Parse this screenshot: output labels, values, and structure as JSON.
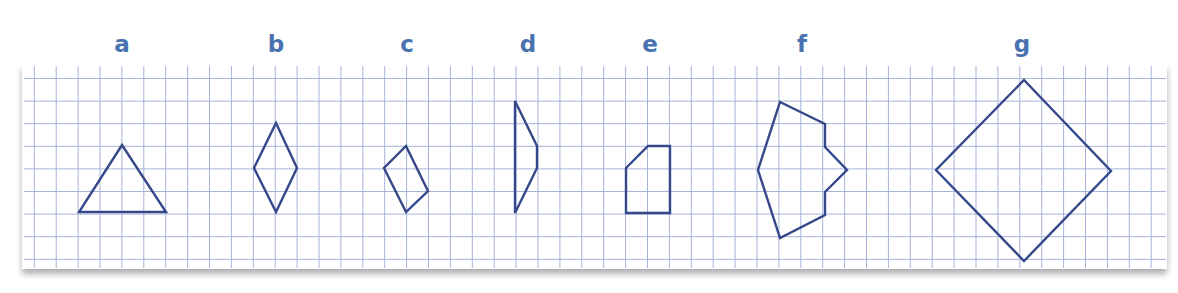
{
  "colors": {
    "label": "#4a72b0",
    "shape_stroke": "#36478a",
    "grid": "#a6b3da",
    "paper": "#ffffff",
    "shadow": "#9a9a9a"
  },
  "paper": {
    "x": 22,
    "y": 64,
    "width": 1145,
    "height": 205
  },
  "grid": {
    "x0": 34.3,
    "dx": 21.9,
    "nx": 52,
    "y0": 78.5,
    "dy": 22.6,
    "ny": 9
  },
  "figures": [
    {
      "label": "a",
      "label_x": 122,
      "points": [
        [
          122,
          145
        ],
        [
          166,
          212
        ],
        [
          79,
          212
        ]
      ]
    },
    {
      "label": "b",
      "label_x": 276,
      "points": [
        [
          276,
          123
        ],
        [
          297,
          168
        ],
        [
          276,
          212
        ],
        [
          254,
          168
        ]
      ]
    },
    {
      "label": "c",
      "label_x": 407,
      "points": [
        [
          406,
          146
        ],
        [
          428,
          191
        ],
        [
          406,
          212
        ],
        [
          384,
          168
        ]
      ]
    },
    {
      "label": "d",
      "label_x": 528,
      "points": [
        [
          515,
          101
        ],
        [
          537,
          146
        ],
        [
          537,
          168
        ],
        [
          515,
          213
        ]
      ]
    },
    {
      "label": "e",
      "label_x": 650,
      "points": [
        [
          626,
          168
        ],
        [
          648,
          146
        ],
        [
          670,
          146
        ],
        [
          670,
          213
        ],
        [
          626,
          213
        ]
      ]
    },
    {
      "label": "f",
      "label_x": 802,
      "points": [
        [
          780,
          102
        ],
        [
          825,
          124
        ],
        [
          825,
          147
        ],
        [
          847,
          170
        ],
        [
          825,
          192
        ],
        [
          825,
          215
        ],
        [
          780,
          238
        ],
        [
          758,
          170
        ]
      ]
    },
    {
      "label": "g",
      "label_x": 1022,
      "points": [
        [
          1024,
          80
        ],
        [
          1111,
          171
        ],
        [
          1024,
          261
        ],
        [
          936,
          170
        ]
      ]
    }
  ],
  "label_y": 52
}
